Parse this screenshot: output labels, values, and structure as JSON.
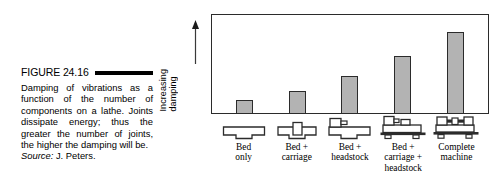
{
  "figure": {
    "number": "FIGURE 24.16",
    "body": "Damping of vibrations as a function of the number of components on a lathe. Joints dissipate energy; thus the greater the number of joints, the higher the damping will be.",
    "source_word": "Source:",
    "source_text": " J. Peters."
  },
  "chart_data": {
    "type": "bar",
    "title": "Damping of vibrations as a function of the number of components on a lathe",
    "xlabel": "",
    "ylabel": "Increasing\ndamping",
    "ylim": [
      0,
      100
    ],
    "grid": false,
    "legend": "none",
    "categories": [
      "Bed\nonly",
      "Bed +\ncarriage",
      "Bed +\nheadstock",
      "Bed +\ncarriage +\nheadstock",
      "Complete\nmachine"
    ],
    "values": [
      13,
      22,
      38,
      58,
      83
    ],
    "bar_fill": "#b3b3b3",
    "bar_stroke": "#2b2b2b",
    "icons": [
      "lathe-bed-icon",
      "lathe-bed-carriage-icon",
      "lathe-bed-headstock-icon",
      "lathe-bed-carriage-headstock-icon",
      "lathe-complete-machine-icon"
    ]
  }
}
